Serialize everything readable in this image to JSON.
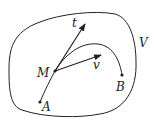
{
  "diagram": {
    "region_label": "V",
    "points": {
      "A": "A",
      "B": "B",
      "M": "M"
    },
    "vectors": {
      "tangent": "t",
      "velocity": "v"
    },
    "colors": {
      "stroke": "#222222",
      "background": "#ffffff"
    }
  }
}
